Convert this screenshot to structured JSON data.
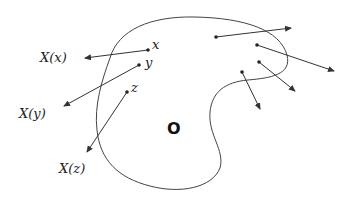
{
  "diagram": {
    "labels": {
      "point_x": "x",
      "point_y": "y",
      "point_z": "z",
      "vector_x": "X(x)",
      "vector_y": "X(y)",
      "vector_z": "X(z)",
      "origin": "O"
    },
    "colors": {
      "stroke": "#333333",
      "text": "#222222"
    }
  }
}
